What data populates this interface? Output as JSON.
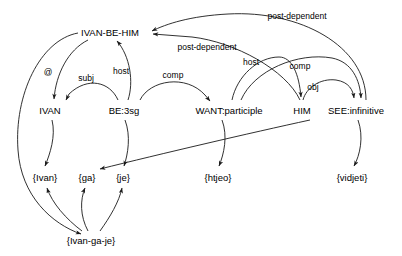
{
  "diagram": {
    "background_color": "#ffffff",
    "stroke_color": "#1a1a1a",
    "nodes": [
      {
        "id": "ivan-be-him",
        "label": "IVAN-BE-HIM",
        "x": 110,
        "y": 32
      },
      {
        "id": "ivan",
        "label": "IVAN",
        "x": 50,
        "y": 110
      },
      {
        "id": "be3sg",
        "label": "BE:3sg",
        "x": 124,
        "y": 110
      },
      {
        "id": "want-participle",
        "label": "WANT:participle",
        "x": 229,
        "y": 110
      },
      {
        "id": "him",
        "label": "HIM",
        "x": 302,
        "y": 110
      },
      {
        "id": "see-infinitive",
        "label": "SEE:infinitive",
        "x": 356,
        "y": 110
      },
      {
        "id": "tok-ivan",
        "label": "{Ivan}",
        "x": 45,
        "y": 177
      },
      {
        "id": "tok-ga",
        "label": "{ga}",
        "x": 87,
        "y": 177
      },
      {
        "id": "tok-je",
        "label": "{je}",
        "x": 123,
        "y": 177
      },
      {
        "id": "tok-htjeo",
        "label": "{htjeo}",
        "x": 218,
        "y": 177
      },
      {
        "id": "tok-vidjeti",
        "label": "{vidjeti}",
        "x": 352,
        "y": 177
      },
      {
        "id": "tok-ivangaje",
        "label": "{Ivan-ga-je}",
        "x": 91,
        "y": 240
      }
    ],
    "edge_labels": [
      {
        "id": "at",
        "label": "@",
        "x": 48,
        "y": 72
      },
      {
        "id": "subj",
        "label": "subj",
        "x": 86,
        "y": 78
      },
      {
        "id": "host-1",
        "label": "host",
        "x": 121,
        "y": 71
      },
      {
        "id": "comp-1",
        "label": "comp",
        "x": 173,
        "y": 75
      },
      {
        "id": "post-dependent-1",
        "label": "post-dependent",
        "x": 207,
        "y": 47
      },
      {
        "id": "post-dependent-2",
        "label": "post-dependent",
        "x": 297,
        "y": 16
      },
      {
        "id": "host-2",
        "label": "host",
        "x": 251,
        "y": 62
      },
      {
        "id": "comp-2",
        "label": "comp",
        "x": 300,
        "y": 66
      },
      {
        "id": "obj",
        "label": "obj",
        "x": 313,
        "y": 87
      }
    ],
    "edges": [
      {
        "id": "ivanbehim-to-tok-ivangaje",
        "from": "ivan-be-him",
        "to": "tok-ivan-ga-je",
        "label": ""
      },
      {
        "id": "ivanbehim-to-ivan",
        "from": "ivan-be-him",
        "to": "ivan",
        "label": "@"
      },
      {
        "id": "be3sg-to-ivan",
        "from": "be3sg",
        "to": "ivan",
        "label": "subj"
      },
      {
        "id": "be3sg-to-ivanbehim",
        "from": "be3sg",
        "to": "ivan-be-him",
        "label": "host"
      },
      {
        "id": "be3sg-to-want",
        "from": "be3sg",
        "to": "want-participle",
        "label": "comp"
      },
      {
        "id": "him-to-ivanbehim",
        "from": "him",
        "to": "ivan-be-him",
        "label": "post-dependent"
      },
      {
        "id": "see-to-ivanbehim",
        "from": "see-infinitive",
        "to": "ivan-be-him",
        "label": "post-dependent"
      },
      {
        "id": "want-to-him-host",
        "from": "want-participle",
        "to": "him",
        "label": "host"
      },
      {
        "id": "want-to-see-comp",
        "from": "want-participle",
        "to": "see-infinitive",
        "label": "comp"
      },
      {
        "id": "him-to-see-obj",
        "from": "him",
        "to": "see-infinitive",
        "label": "obj"
      },
      {
        "id": "ivan-to-tok-ivan",
        "from": "ivan",
        "to": "tok-ivan",
        "label": ""
      },
      {
        "id": "be3sg-to-tok-je",
        "from": "be3sg",
        "to": "tok-je",
        "label": ""
      },
      {
        "id": "want-to-tok-htjeo",
        "from": "want-participle",
        "to": "tok-htjeo",
        "label": ""
      },
      {
        "id": "him-to-tok-ga",
        "from": "him",
        "to": "tok-ga",
        "label": ""
      },
      {
        "id": "see-to-tok-vidjeti",
        "from": "see-infinitive",
        "to": "tok-vidjeti",
        "label": ""
      },
      {
        "id": "ivangaje-to-tok-ivan",
        "from": "tok-ivangaje",
        "to": "tok-ivan",
        "label": ""
      },
      {
        "id": "ivangaje-to-tok-ga",
        "from": "tok-ivangaje",
        "to": "tok-ga",
        "label": ""
      },
      {
        "id": "ivangaje-to-tok-je",
        "from": "tok-ivangaje",
        "to": "tok-je",
        "label": ""
      }
    ]
  }
}
